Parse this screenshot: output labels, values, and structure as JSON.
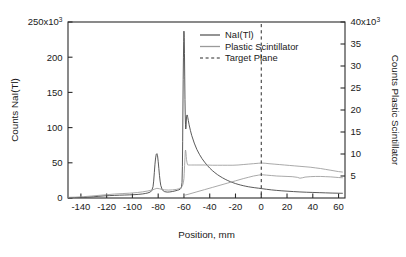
{
  "chart_data": {
    "type": "line",
    "title": "",
    "xlabel": "Position, mm",
    "ylabel": "Counts NaI(Tl)",
    "y2label": "Counts Plastic Scintillator",
    "xlim": [
      -150,
      65
    ],
    "ylim": [
      0,
      250
    ],
    "y2lim": [
      0,
      40
    ],
    "y_scale_note": "250x10^3",
    "y2_scale_note": "40x10^3",
    "grid": false,
    "legend_position": "top-right-inside",
    "xticks": [
      -140,
      -120,
      -100,
      -80,
      -60,
      -40,
      -20,
      0,
      20,
      40,
      60
    ],
    "xticklabels": [
      "-140",
      "-120",
      "-100",
      "-80",
      "-60",
      "-40",
      "-20",
      "0",
      "20",
      "40",
      "60"
    ],
    "yticks": [
      0,
      50,
      100,
      150,
      200,
      250
    ],
    "yticklabels": [
      "0",
      "50",
      "100",
      "150",
      "200",
      "250x10"
    ],
    "ytick_superscript": "3",
    "y2ticks": [
      5,
      10,
      15,
      20,
      25,
      30,
      35,
      40
    ],
    "y2ticklabels": [
      "5",
      "10",
      "15",
      "20",
      "25",
      "30",
      "35",
      "40x10"
    ],
    "y2tick_superscript": "3",
    "series": [
      {
        "name": "NaI(Tl)",
        "axis": "left",
        "color": "#3c3c3c",
        "style": "solid",
        "x": [
          -150,
          -145,
          -140,
          -135,
          -130,
          -126,
          -122,
          -118,
          -114,
          -110,
          -106,
          -102,
          -98,
          -95,
          -92,
          -90,
          -88,
          -86,
          -85,
          -84,
          -83.5,
          -83,
          -82.5,
          -82,
          -81.5,
          -81,
          -80.5,
          -80,
          -79.5,
          -79,
          -78.5,
          -78,
          -77,
          -76,
          -75,
          -73,
          -71,
          -69,
          -67,
          -65,
          -64,
          -63,
          -62.5,
          -62,
          -61.5,
          -61.2,
          -61,
          -60.8,
          -60.6,
          -60.4,
          -60.2,
          -60,
          -59.8,
          -59.6,
          -59.4,
          -59.2,
          -59,
          -58.8,
          -58.6,
          -58.4,
          -58.2,
          -58,
          -57.6,
          -57.2,
          -57,
          -56.6,
          -56,
          -55,
          -54,
          -52,
          -50,
          -48,
          -46,
          -44,
          -42,
          -40,
          -38,
          -36,
          -34,
          -32,
          -30,
          -28,
          -26,
          -24,
          -22,
          -20,
          -18,
          -16,
          -14,
          -12,
          -10,
          -8,
          -5,
          -2,
          0,
          4,
          8,
          12,
          16,
          20,
          25,
          30,
          35,
          40,
          45,
          50,
          55,
          60,
          63
        ],
        "y": [
          0.5,
          0.6,
          0.8,
          1.2,
          1.8,
          2.4,
          3.0,
          3.4,
          3.7,
          4.0,
          4.2,
          4.5,
          4.8,
          5.2,
          5.8,
          6.4,
          7.2,
          8.6,
          10.5,
          16.0,
          24.0,
          36.0,
          48.0,
          57.0,
          62.0,
          63.0,
          60.0,
          52.0,
          42.0,
          32.0,
          24.0,
          18.0,
          12.5,
          10.0,
          9.0,
          8.4,
          8.6,
          9.2,
          10.0,
          11.0,
          11.6,
          12.4,
          13.4,
          15.0,
          22.0,
          45.0,
          80.0,
          125.0,
          168.0,
          200.0,
          222.0,
          237.0,
          228.0,
          205.0,
          172.0,
          140.0,
          118.0,
          104.0,
          98.0,
          100.0,
          108.0,
          115.0,
          118.0,
          116.0,
          114.0,
          110.0,
          104.0,
          96.0,
          89.0,
          78.0,
          69.0,
          62.0,
          56.0,
          51.0,
          46.5,
          42.5,
          39.0,
          36.0,
          33.2,
          30.8,
          28.6,
          26.6,
          24.8,
          23.2,
          21.8,
          20.5,
          19.4,
          18.4,
          17.5,
          16.7,
          16.0,
          15.4,
          14.6,
          13.9,
          13.4,
          12.4,
          11.5,
          10.8,
          10.2,
          9.7,
          9.1,
          8.6,
          8.2,
          7.9,
          7.6,
          7.3,
          7.0,
          6.8,
          6.7
        ]
      },
      {
        "name": "Plastic Scintillator",
        "axis": "right",
        "color": "#9a9a9a",
        "style": "solid",
        "x": [
          -150,
          -144,
          -138,
          -132,
          -126,
          -120,
          -114,
          -108,
          -102,
          -96,
          -92,
          -88,
          -85,
          -83,
          -81,
          -79,
          -77,
          -75,
          -72,
          -69,
          -66,
          -64,
          -62,
          -61,
          -60.4,
          -60,
          -59.8,
          -59.5,
          -59.2,
          -59,
          -58.8,
          -58.6,
          -58.4,
          -58.2,
          -58,
          -57.6,
          -57.2,
          -57,
          -56.5,
          -56,
          -55,
          -54,
          -52,
          -50,
          -46,
          -42,
          -38,
          -34,
          -30,
          -26,
          -22,
          -18,
          -14,
          -10,
          -6,
          -2,
          0,
          3,
          6,
          10,
          14,
          18,
          22,
          26,
          30,
          34,
          38,
          42,
          46,
          50,
          54,
          58,
          60,
          63
        ],
        "y": [
          0.15,
          0.2,
          0.3,
          0.45,
          0.6,
          0.75,
          0.9,
          1.0,
          1.1,
          1.25,
          1.4,
          1.6,
          1.8,
          2.0,
          2.2,
          2.1,
          1.95,
          1.85,
          1.8,
          1.85,
          1.95,
          2.1,
          2.4,
          2.9,
          3.6,
          4.4,
          5.6,
          7.4,
          9.2,
          10.6,
          10.9,
          10.7,
          10.2,
          9.4,
          8.7,
          8.0,
          7.6,
          7.5,
          7.5,
          7.5,
          7.5,
          7.5,
          7.5,
          7.5,
          7.5,
          7.5,
          7.45,
          7.45,
          7.45,
          7.45,
          7.45,
          7.5,
          7.6,
          7.7,
          7.8,
          7.9,
          7.95,
          7.9,
          7.8,
          7.7,
          7.6,
          7.5,
          7.4,
          7.3,
          7.2,
          7.1,
          7.0,
          6.85,
          6.7,
          6.5,
          6.3,
          6.1,
          6.0,
          5.9
        ]
      },
      {
        "name": "Plastic Scintillator baseline tail",
        "axis": "right",
        "color": "#9a9a9a",
        "style": "solid",
        "x": [
          -60,
          -56,
          -50,
          -44,
          -38,
          -32,
          -26,
          -20,
          -14,
          -10,
          -6,
          -2,
          0,
          4,
          8,
          12,
          16,
          20,
          24,
          28,
          30,
          32,
          34,
          38,
          42,
          46,
          50,
          54,
          58,
          60,
          63
        ],
        "y": [
          0.6,
          0.9,
          1.4,
          1.9,
          2.4,
          2.9,
          3.4,
          3.9,
          4.4,
          4.7,
          5.0,
          5.2,
          5.3,
          5.2,
          5.1,
          5.0,
          4.95,
          4.9,
          4.85,
          4.7,
          4.5,
          4.6,
          4.75,
          4.85,
          4.9,
          4.9,
          4.85,
          4.8,
          4.7,
          4.65,
          4.6
        ]
      },
      {
        "name": "Target Plane",
        "axis": "left",
        "color": "#2b2b2b",
        "style": "dashed",
        "vertical_at_x": 0
      }
    ],
    "legend": [
      {
        "label": "NaI(Tl)",
        "style": "solid",
        "color": "#3c3c3c"
      },
      {
        "label": "Plastic Scintillator",
        "style": "solid",
        "color": "#9a9a9a"
      },
      {
        "label": "Target Plane",
        "style": "dashed",
        "color": "#2b2b2b"
      }
    ],
    "annotations": [
      {
        "text": "main NaI(Tl) peak",
        "x": -60.5,
        "y": 237
      },
      {
        "text": "secondary NaI(Tl) shoulder",
        "x": -57.5,
        "y": 118
      },
      {
        "text": "NaI(Tl) side peak",
        "x": -81,
        "y": 63
      },
      {
        "text": "plastic scintillator peak",
        "x": -58.7,
        "y": 10.9
      }
    ]
  }
}
